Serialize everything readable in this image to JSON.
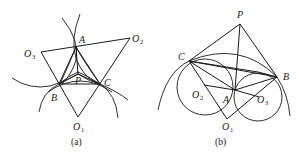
{
  "diagram_a": {
    "caption": "(a)",
    "labels": {
      "A": "A",
      "B": "B",
      "C": "C",
      "P": "P",
      "O1": "O",
      "O1_sub": "1",
      "O2": "O",
      "O2_sub": "2",
      "O3": "O",
      "O3_sub": "3"
    }
  },
  "diagram_b": {
    "caption": "(b)",
    "labels": {
      "A": "A",
      "B": "B",
      "C": "C",
      "P": "P",
      "O1": "O",
      "O1_sub": "1",
      "O2": "O",
      "O2_sub": "2",
      "O3": "O",
      "O3_sub": "3"
    }
  },
  "colors": {
    "stroke": "#1a1a1a",
    "background": "#ffffff"
  }
}
